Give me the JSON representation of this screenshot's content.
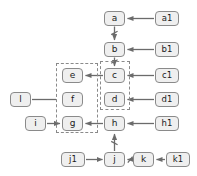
{
  "diagram": {
    "style": {
      "node_fill": "#efefef",
      "node_border": "#8a8a8a",
      "text_color": "#1b1b1b",
      "edge_color": "#6b6b6b",
      "group_border": "#8a8a8a",
      "background": "#ffffff"
    },
    "nodes": [
      {
        "id": "a",
        "label": "a",
        "x": 104,
        "y": 11,
        "w": 21,
        "h": 15
      },
      {
        "id": "a1",
        "label": "a1",
        "x": 155,
        "y": 11,
        "w": 24,
        "h": 15
      },
      {
        "id": "b",
        "label": "b",
        "x": 104,
        "y": 42,
        "w": 21,
        "h": 15
      },
      {
        "id": "b1",
        "label": "b1",
        "x": 155,
        "y": 42,
        "w": 24,
        "h": 15
      },
      {
        "id": "e",
        "label": "e",
        "x": 62,
        "y": 68,
        "w": 21,
        "h": 15
      },
      {
        "id": "c",
        "label": "c",
        "x": 104,
        "y": 68,
        "w": 21,
        "h": 15
      },
      {
        "id": "c1",
        "label": "c1",
        "x": 155,
        "y": 68,
        "w": 24,
        "h": 15
      },
      {
        "id": "l",
        "label": "l",
        "x": 10,
        "y": 92,
        "w": 21,
        "h": 15
      },
      {
        "id": "f",
        "label": "f",
        "x": 62,
        "y": 92,
        "w": 21,
        "h": 15
      },
      {
        "id": "d",
        "label": "d",
        "x": 104,
        "y": 92,
        "w": 21,
        "h": 15
      },
      {
        "id": "d1",
        "label": "d1",
        "x": 155,
        "y": 92,
        "w": 24,
        "h": 15
      },
      {
        "id": "i",
        "label": "i",
        "x": 25,
        "y": 116,
        "w": 21,
        "h": 15
      },
      {
        "id": "g",
        "label": "g",
        "x": 62,
        "y": 116,
        "w": 21,
        "h": 15
      },
      {
        "id": "h",
        "label": "h",
        "x": 104,
        "y": 116,
        "w": 21,
        "h": 15
      },
      {
        "id": "h1",
        "label": "h1",
        "x": 155,
        "y": 116,
        "w": 24,
        "h": 15
      },
      {
        "id": "j1",
        "label": "j1",
        "x": 61,
        "y": 152,
        "w": 24,
        "h": 15
      },
      {
        "id": "j",
        "label": "j",
        "x": 104,
        "y": 152,
        "w": 21,
        "h": 15
      },
      {
        "id": "k",
        "label": "k",
        "x": 133,
        "y": 152,
        "w": 21,
        "h": 15
      },
      {
        "id": "k1",
        "label": "k1",
        "x": 166,
        "y": 152,
        "w": 24,
        "h": 15
      }
    ],
    "groups": [
      {
        "id": "group-left",
        "label": "efg-group",
        "x": 56,
        "y": 63,
        "w": 42,
        "h": 70
      },
      {
        "id": "group-right",
        "label": "cd-group",
        "x": 100,
        "y": 61,
        "w": 30,
        "h": 49
      }
    ],
    "edges": [
      {
        "id": "a1-a",
        "from": "a1",
        "to": "a",
        "kind": "arrow"
      },
      {
        "id": "a-b",
        "from": "a",
        "to": "b",
        "kind": "tick-arrow"
      },
      {
        "id": "b1-b",
        "from": "b1",
        "to": "b",
        "kind": "arrow"
      },
      {
        "id": "b-c",
        "from": "b",
        "to": "c",
        "kind": "tick-arrow"
      },
      {
        "id": "c1-c",
        "from": "c1",
        "to": "c",
        "kind": "arrow"
      },
      {
        "id": "c-e",
        "from": "c",
        "to": "e",
        "kind": "arrow"
      },
      {
        "id": "d1-d",
        "from": "d1",
        "to": "d",
        "kind": "arrow"
      },
      {
        "id": "l-group",
        "from": "l",
        "to": "group-left",
        "kind": "line"
      },
      {
        "id": "i-g",
        "from": "i",
        "to": "g",
        "kind": "arrow"
      },
      {
        "id": "h-g",
        "from": "h",
        "to": "g",
        "kind": "arrow"
      },
      {
        "id": "h1-h",
        "from": "h1",
        "to": "h",
        "kind": "arrow"
      },
      {
        "id": "j-h",
        "from": "j",
        "to": "h",
        "kind": "tick-arrow"
      },
      {
        "id": "j1-j",
        "from": "j1",
        "to": "j",
        "kind": "arrow"
      },
      {
        "id": "k-j",
        "from": "k",
        "to": "j",
        "kind": "tick-arrow"
      },
      {
        "id": "k1-k",
        "from": "k1",
        "to": "k",
        "kind": "arrow"
      }
    ]
  }
}
